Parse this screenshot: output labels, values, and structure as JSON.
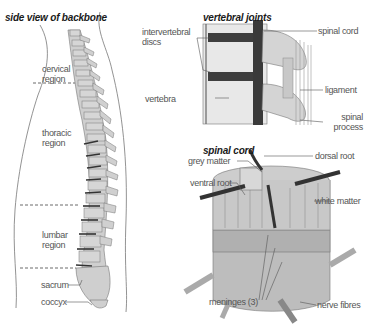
{
  "panels": {
    "side_view": {
      "title": "side view of backbone",
      "labels": {
        "cervical_1": "cervical",
        "cervical_2": "region",
        "thoracic_1": "thoracic",
        "thoracic_2": "region",
        "lumbar_1": "lumbar",
        "lumbar_2": "region",
        "sacrum": "sacrum",
        "coccyx": "coccyx"
      }
    },
    "vertebral_joints": {
      "title": "vertebral joints",
      "labels": {
        "discs_1": "intervertebral",
        "discs_2": "discs",
        "vertebra": "vertebra",
        "spinal_cord": "spinal cord",
        "ligament": "ligament",
        "spinal_process_1": "spinal",
        "spinal_process_2": "process"
      }
    },
    "spinal_cord": {
      "title": "spinal cord",
      "labels": {
        "grey_matter": "grey matter",
        "ventral_root": "ventral root",
        "dorsal_root": "dorsal root",
        "white_matter": "white matter",
        "meninges": "meninges (3)",
        "nerve_fibres": "nerve fibres"
      }
    }
  },
  "colors": {
    "bone": "#cfcfcf",
    "bone_dark": "#a8a8a8",
    "disc": "#3a3a3a",
    "outline": "#666666",
    "text": "#555555",
    "cord": "#b9b9b9"
  }
}
